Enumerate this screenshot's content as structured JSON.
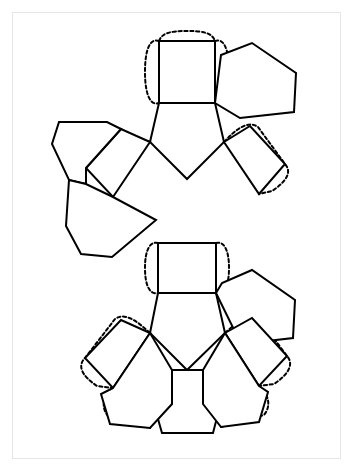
{
  "document": {
    "title": "Polyhedron Net Template",
    "kind": "papercraft-net",
    "page_background": "#ffffff",
    "frame_border_color": "#e6e6e6",
    "canvas": {
      "width": 354,
      "height": 472
    },
    "frame": {
      "x": 12,
      "y": 12,
      "width": 329,
      "height": 447
    }
  },
  "style": {
    "fold_line_color": "#000000",
    "fold_line_width": 2.0,
    "glue_tab_color": "#000000",
    "glue_tab_width": 2.0,
    "glue_tab_dash": "3.2 2.6",
    "face_fill": "#ffffff"
  },
  "net": {
    "description": "Symmetric net of squares and pentagons arranged in two mirrored clusters joined by a central square",
    "face_count": 16,
    "tab_count": 9,
    "faces": [
      {
        "id": "square-top",
        "type": "square",
        "label": "Top square",
        "points": "159,41 215,41 215,103 159,103"
      },
      {
        "id": "pentagon-top-center",
        "type": "pentagon",
        "label": "Upper central pentagon",
        "points": "159,103 215,103 224,142 187,179 150,142"
      },
      {
        "id": "pentagon-top-right",
        "type": "pentagon",
        "label": "Upper right pentagon",
        "points": "215,103 221,55 252,43 296,73 294,112 240,118"
      },
      {
        "id": "square-upper-left",
        "type": "square",
        "label": "Upper left tilted square",
        "points": "150,142 121,129 86,168 113,197"
      },
      {
        "id": "pentagon-upper-far-left",
        "type": "pentagon",
        "label": "Upper far-left pentagon",
        "points": "121,129 107,122 59,122 52,144 69,180 86,184 86,168"
      },
      {
        "id": "square-upper-right",
        "type": "square",
        "label": "Upper right tilted square",
        "points": "224,142 250,126 285,164 259,194"
      },
      {
        "id": "pentagon-mid-left",
        "type": "pentagon",
        "label": "Middle left pentagon",
        "points": "86,184 69,180 66,226 81,254 112,257 156,220 113,197"
      },
      {
        "id": "square-center-link",
        "type": "square",
        "label": "Central connecting square",
        "points": "158,243 216,243 216,293 158,293"
      },
      {
        "id": "pentagon-bottom-center",
        "type": "pentagon",
        "label": "Lower central pentagon",
        "points": "158,293 216,293 225,333 187,370 150,333"
      },
      {
        "id": "pentagon-bottom-right",
        "type": "pentagon",
        "label": "Lower right pentagon",
        "points": "216,293 222,283 252,270 295,300 293,338 241,344"
      },
      {
        "id": "square-lower-left",
        "type": "square",
        "label": "Lower left tilted square",
        "points": "150,333 121,320 85,358 113,388"
      },
      {
        "id": "square-lower-right",
        "type": "square",
        "label": "Lower right tilted square",
        "points": "225,333 252,318 287,356 259,386"
      },
      {
        "id": "pentagon-bottom",
        "type": "pentagon",
        "label": "Bottom pentagon",
        "points": "172,370 203,370 222,398 213,433 162,433 152,398"
      },
      {
        "id": "pentagon-lower-left-wing",
        "type": "pentagon",
        "label": "Lower left wing pentagon",
        "points": "113,388 101,394 110,424 150,428 172,404 172,370 150,333"
      },
      {
        "id": "pentagon-lower-right-wing",
        "type": "pentagon",
        "label": "Lower right wing pentagon",
        "points": "259,386 268,392 259,422 221,427 203,404 203,370 225,333"
      }
    ],
    "glue_tabs": [
      {
        "id": "tab-top-square-left",
        "label": "Top square left glue tab",
        "path": "M159,41 C151,38 145,47 145,72 C145,96 151,106 159,103"
      },
      {
        "id": "tab-top-square-top",
        "label": "Top square top glue tab",
        "path": "M159,41 C162,33 170,31 187,31 C204,31 212,33 215,41"
      },
      {
        "id": "tab-top-square-right",
        "label": "Top square right glue tab",
        "path": "M215,41 C223,38 229,47 229,72 C229,96 223,106 215,103"
      },
      {
        "id": "tab-upper-left-square",
        "label": "Upper left tilted square glue tab",
        "path": "M150,142 C135,137 118,133 111,141 L86,168"
      },
      {
        "id": "tab-upper-right-square",
        "label": "Upper right tilted square glue tab",
        "path": "M224,142 C236,129 248,120 258,127 L285,164 C292,172 287,181 272,191 L259,194"
      },
      {
        "id": "tab-center-square-left",
        "label": "Central square left glue tab",
        "path": "M158,243 C150,241 145,250 145,268 C145,286 150,295 158,293"
      },
      {
        "id": "tab-center-square-right",
        "label": "Central square right glue tab",
        "path": "M216,243 C224,241 229,250 229,268 C229,286 224,295 216,293"
      },
      {
        "id": "tab-lower-left-square",
        "label": "Lower left tilted square glue tab",
        "path": "M150,333 C137,321 125,312 115,319 L85,358 C77,366 82,376 97,386 L113,388"
      },
      {
        "id": "tab-lower-left-wing",
        "label": "Lower left wing glue tab",
        "path": "M113,388 C104,396 100,406 108,416 L150,428"
      },
      {
        "id": "tab-lower-right-square",
        "label": "Lower right tilted square glue tab",
        "path": "M225,333 C238,321 250,313 260,320 L287,356 C294,364 289,374 274,384 L259,386"
      },
      {
        "id": "tab-lower-right-wing",
        "label": "Lower right wing glue tab",
        "path": "M259,386 C268,394 272,405 264,415 L221,427"
      }
    ]
  }
}
